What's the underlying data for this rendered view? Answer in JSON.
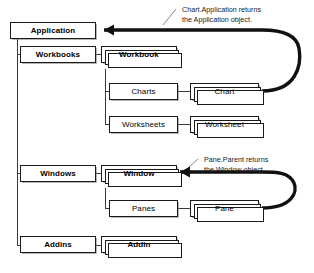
{
  "diagram": {
    "type": "object-hierarchy",
    "background_color": "#ffffff",
    "line_color": "#1a1a1a",
    "box_fill": "#ffffff",
    "nodes": [
      {
        "id": "application",
        "label": "Application",
        "kind": "object",
        "x": 10,
        "y": 22,
        "w": 86,
        "h": 17
      },
      {
        "id": "workbooks",
        "label": "Workbooks",
        "kind": "object",
        "x": 20,
        "y": 46,
        "w": 76,
        "h": 17
      },
      {
        "id": "workbook",
        "label": "Workbook",
        "kind": "collection",
        "x": 101,
        "y": 46,
        "w": 76,
        "h": 17
      },
      {
        "id": "charts",
        "label": "Charts",
        "kind": "object",
        "x": 109,
        "y": 83,
        "w": 69,
        "h": 17
      },
      {
        "id": "chart",
        "label": "Chart",
        "kind": "collection",
        "x": 190,
        "y": 83,
        "w": 69,
        "h": 17
      },
      {
        "id": "worksheets",
        "label": "Worksheets",
        "kind": "object",
        "x": 109,
        "y": 116,
        "w": 69,
        "h": 17
      },
      {
        "id": "worksheet",
        "label": "Worksheet",
        "kind": "collection",
        "x": 190,
        "y": 116,
        "w": 69,
        "h": 17
      },
      {
        "id": "windows",
        "label": "Windows",
        "kind": "object",
        "x": 20,
        "y": 165,
        "w": 76,
        "h": 17
      },
      {
        "id": "window",
        "label": "Window",
        "kind": "collection",
        "x": 101,
        "y": 165,
        "w": 76,
        "h": 17
      },
      {
        "id": "panes",
        "label": "Panes",
        "kind": "object",
        "x": 109,
        "y": 200,
        "w": 69,
        "h": 17
      },
      {
        "id": "pane",
        "label": "Pane",
        "kind": "collection",
        "x": 190,
        "y": 200,
        "w": 69,
        "h": 17
      },
      {
        "id": "addins",
        "label": "Addins",
        "kind": "object",
        "x": 20,
        "y": 236,
        "w": 76,
        "h": 17
      },
      {
        "id": "addin",
        "label": "Addin",
        "kind": "collection",
        "x": 101,
        "y": 236,
        "w": 76,
        "h": 17
      }
    ],
    "annotations": [
      {
        "id": "chart-application-note",
        "text": "Chart.Application returns\nthe Application object.",
        "x": 179,
        "y": 5,
        "target": "application",
        "source": "chart"
      },
      {
        "id": "pane-parent-note",
        "text": "Pane.Parent returns\nthe Window object.",
        "x": 201,
        "y": 155,
        "target": "window",
        "source": "pane"
      }
    ],
    "edges": [
      {
        "from": "application",
        "to": "workbooks"
      },
      {
        "from": "application",
        "to": "windows"
      },
      {
        "from": "application",
        "to": "addins"
      },
      {
        "from": "workbooks",
        "to": "workbook"
      },
      {
        "from": "workbook",
        "to": "charts"
      },
      {
        "from": "workbook",
        "to": "worksheets"
      },
      {
        "from": "charts",
        "to": "chart"
      },
      {
        "from": "worksheets",
        "to": "worksheet"
      },
      {
        "from": "windows",
        "to": "window"
      },
      {
        "from": "window",
        "to": "panes"
      },
      {
        "from": "panes",
        "to": "pane"
      },
      {
        "from": "addins",
        "to": "addin"
      }
    ]
  }
}
